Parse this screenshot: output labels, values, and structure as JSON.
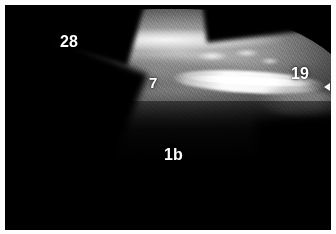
{
  "image": {
    "modality": "ultrasound",
    "mode": "B-mode grayscale",
    "width": 336,
    "height": 234,
    "background_color": "#000000",
    "border_color": "#fdfdfd",
    "label_color": "#ffffff"
  },
  "annotations": [
    {
      "id": "label-28",
      "text": "28",
      "x": 55,
      "y": 29,
      "font_size": 16,
      "region": "superficial soft tissue, upper left"
    },
    {
      "id": "label-7",
      "text": "7",
      "x": 144,
      "y": 70,
      "font_size": 15,
      "region": "mid hypoechoic band, center"
    },
    {
      "id": "label-19",
      "text": "19",
      "x": 286,
      "y": 61,
      "font_size": 16,
      "region": "right lateral soft tissue"
    },
    {
      "id": "label-1b",
      "text": "1b",
      "x": 159,
      "y": 142,
      "font_size": 16,
      "region": "acoustic shadow below bright interface"
    }
  ],
  "features": {
    "capsule_line": "bright convex superficial line across top",
    "bone_line": "bright hyperechoic linear interface, right half",
    "acoustic_shadow": "dark anechoic region occupying lower third",
    "edge_marker": "small white pointer at right edge"
  }
}
